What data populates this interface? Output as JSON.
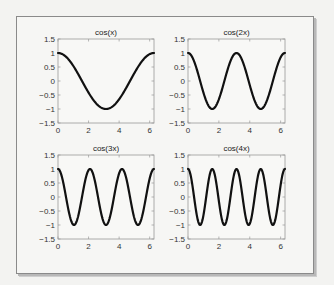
{
  "chart_data": [
    {
      "type": "line",
      "title": "cos(x)",
      "xlabel": "",
      "ylabel": "",
      "xlim": [
        0,
        6.2832
      ],
      "ylim": [
        -1.5,
        1.5
      ],
      "xticks": [
        0,
        2,
        4,
        6
      ],
      "yticks": [
        -1.5,
        -1,
        -0.5,
        0,
        0.5,
        1,
        1.5
      ],
      "xtick_labels": [
        "0",
        "2",
        "4",
        "6"
      ],
      "ytick_labels": [
        "-1.5",
        "-1",
        "-0.5",
        "0",
        "0.5",
        "1",
        "1.5"
      ],
      "grid": false,
      "series": [
        {
          "name": "cos(x)",
          "function": "cos(1*x)",
          "frequency": 1,
          "x_range": [
            0,
            6.2832
          ],
          "x": [
            0,
            0.785,
            1.571,
            2.356,
            3.142,
            3.927,
            4.712,
            5.498,
            6.283
          ],
          "values": [
            1,
            0.707,
            0,
            -0.707,
            -1,
            -0.707,
            0,
            0.707,
            1
          ]
        }
      ]
    },
    {
      "type": "line",
      "title": "cos(2x)",
      "xlabel": "",
      "ylabel": "",
      "xlim": [
        0,
        6.2832
      ],
      "ylim": [
        -1.5,
        1.5
      ],
      "xticks": [
        0,
        2,
        4,
        6
      ],
      "yticks": [
        -1.5,
        -1,
        -0.5,
        0,
        0.5,
        1,
        1.5
      ],
      "xtick_labels": [
        "0",
        "2",
        "4",
        "6"
      ],
      "ytick_labels": [
        "-1.5",
        "-1",
        "-0.5",
        "0",
        "0.5",
        "1",
        "1.5"
      ],
      "grid": false,
      "series": [
        {
          "name": "cos(2x)",
          "function": "cos(2*x)",
          "frequency": 2,
          "x_range": [
            0,
            6.2832
          ],
          "x": [
            0,
            0.785,
            1.571,
            2.356,
            3.142,
            3.927,
            4.712,
            5.498,
            6.283
          ],
          "values": [
            1,
            0,
            -1,
            0,
            1,
            0,
            -1,
            0,
            1
          ]
        }
      ]
    },
    {
      "type": "line",
      "title": "cos(3x)",
      "xlabel": "",
      "ylabel": "",
      "xlim": [
        0,
        6.2832
      ],
      "ylim": [
        -1.5,
        1.5
      ],
      "xticks": [
        0,
        2,
        4,
        6
      ],
      "yticks": [
        -1.5,
        -1,
        -0.5,
        0,
        0.5,
        1,
        1.5
      ],
      "xtick_labels": [
        "0",
        "2",
        "4",
        "6"
      ],
      "ytick_labels": [
        "-1.5",
        "-1",
        "-0.5",
        "0",
        "0.5",
        "1",
        "1.5"
      ],
      "grid": false,
      "series": [
        {
          "name": "cos(3x)",
          "function": "cos(3*x)",
          "frequency": 3,
          "x_range": [
            0,
            6.2832
          ],
          "x": [
            0,
            1.047,
            2.094,
            3.142,
            4.189,
            5.236,
            6.283
          ],
          "values": [
            1,
            -1,
            1,
            -1,
            1,
            -1,
            1
          ]
        }
      ]
    },
    {
      "type": "line",
      "title": "cos(4x)",
      "xlabel": "",
      "ylabel": "",
      "xlim": [
        0,
        6.2832
      ],
      "ylim": [
        -1.5,
        1.5
      ],
      "xticks": [
        0,
        2,
        4,
        6
      ],
      "yticks": [
        -1.5,
        -1,
        -0.5,
        0,
        0.5,
        1,
        1.5
      ],
      "xtick_labels": [
        "0",
        "2",
        "4",
        "6"
      ],
      "ytick_labels": [
        "-1.5",
        "-1",
        "-0.5",
        "0",
        "0.5",
        "1",
        "1.5"
      ],
      "grid": false,
      "series": [
        {
          "name": "cos(4x)",
          "function": "cos(4*x)",
          "frequency": 4,
          "x_range": [
            0,
            6.2832
          ],
          "x": [
            0,
            0.785,
            1.571,
            2.356,
            3.142,
            3.927,
            4.712,
            5.498,
            6.283
          ],
          "values": [
            1,
            -1,
            1,
            -1,
            1,
            -1,
            1,
            -1,
            1
          ]
        }
      ]
    }
  ],
  "style": {
    "line_color": "#111111",
    "axes_color": "#9a9a9a",
    "plot_bg": "#f8f8f6"
  }
}
